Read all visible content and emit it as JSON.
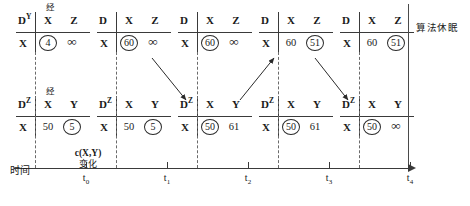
{
  "figure": {
    "right_side_label": "算法休眠",
    "time_axis_label": "时间",
    "annotation": {
      "line1": "c(X,Y)",
      "line2": "变化"
    }
  },
  "axis": {
    "ticks": [
      {
        "label": "t",
        "sub": "0",
        "x": 86
      },
      {
        "label": "t",
        "sub": "1",
        "x": 167
      },
      {
        "label": "t",
        "sub": "2",
        "x": 248
      },
      {
        "label": "t",
        "sub": "3",
        "x": 329
      },
      {
        "label": "t",
        "sub": "4",
        "x": 410
      }
    ]
  },
  "top_row": [
    {
      "jing": "经",
      "corner": "D",
      "corner_sup": "Y",
      "col1": "X",
      "col2": "Z",
      "row_label": "X",
      "cell1": {
        "text": "4",
        "circled": true,
        "infinity": false
      },
      "cell2": {
        "text": "∞",
        "circled": false,
        "infinity": true
      }
    },
    {
      "jing": "",
      "corner": "D",
      "corner_sup": "",
      "col1": "X",
      "col2": "Z",
      "row_label": "X",
      "cell1": {
        "text": "60",
        "circled": true,
        "infinity": false
      },
      "cell2": {
        "text": "∞",
        "circled": false,
        "infinity": true
      }
    },
    {
      "jing": "",
      "corner": "D",
      "corner_sup": "",
      "col1": "X",
      "col2": "Z",
      "row_label": "X",
      "cell1": {
        "text": "60",
        "circled": true,
        "infinity": false
      },
      "cell2": {
        "text": "∞",
        "circled": false,
        "infinity": true
      }
    },
    {
      "jing": "",
      "corner": "D",
      "corner_sup": "",
      "col1": "X",
      "col2": "Z",
      "row_label": "X",
      "cell1": {
        "text": "60",
        "circled": false,
        "infinity": false
      },
      "cell2": {
        "text": "51",
        "circled": true,
        "infinity": false
      }
    },
    {
      "jing": "",
      "corner": "D",
      "corner_sup": "",
      "col1": "X",
      "col2": "Z",
      "row_label": "X",
      "cell1": {
        "text": "60",
        "circled": false,
        "infinity": false
      },
      "cell2": {
        "text": "51",
        "circled": true,
        "infinity": false
      }
    }
  ],
  "bottom_row": [
    {
      "jing": "经",
      "corner": "D",
      "corner_sup": "Z",
      "col1": "X",
      "col2": "Y",
      "row_label": "X",
      "cell1": {
        "text": "50",
        "circled": false,
        "infinity": false
      },
      "cell2": {
        "text": "5",
        "circled": true,
        "infinity": false
      }
    },
    {
      "jing": "",
      "corner": "D",
      "corner_sup": "Z",
      "col1": "X",
      "col2": "Y",
      "row_label": "X",
      "cell1": {
        "text": "50",
        "circled": false,
        "infinity": false
      },
      "cell2": {
        "text": "5",
        "circled": true,
        "infinity": false
      }
    },
    {
      "jing": "",
      "corner": "D",
      "corner_sup": "Z",
      "col1": "X",
      "col2": "Y",
      "row_label": "X",
      "cell1": {
        "text": "50",
        "circled": true,
        "infinity": false
      },
      "cell2": {
        "text": "61",
        "circled": false,
        "infinity": false
      }
    },
    {
      "jing": "",
      "corner": "D",
      "corner_sup": "Z",
      "col1": "X",
      "col2": "Y",
      "row_label": "X",
      "cell1": {
        "text": "50",
        "circled": true,
        "infinity": false
      },
      "cell2": {
        "text": "61",
        "circled": false,
        "infinity": false
      }
    },
    {
      "jing": "",
      "corner": "D",
      "corner_sup": "Z",
      "col1": "X",
      "col2": "Y",
      "row_label": "X",
      "cell1": {
        "text": "50",
        "circled": true,
        "infinity": false
      },
      "cell2": {
        "text": "∞",
        "circled": false,
        "infinity": true
      }
    }
  ],
  "layout": {
    "top_table_x": [
      16,
      97,
      178,
      259,
      340
    ],
    "top_table_y": 12,
    "bottom_table_x": [
      16,
      97,
      178,
      259,
      340
    ],
    "bottom_table_y": 96,
    "dasher_x": [
      35,
      116,
      197,
      278,
      359
    ],
    "arrows": [
      {
        "x1": 152,
        "y1": 58,
        "x2": 186,
        "y2": 100,
        "dir": "down"
      },
      {
        "x1": 240,
        "y1": 100,
        "x2": 274,
        "y2": 58,
        "dir": "up"
      },
      {
        "x1": 315,
        "y1": 58,
        "x2": 348,
        "y2": 100,
        "dir": "down"
      }
    ]
  },
  "colors": {
    "ink": "#1a1a1a",
    "rule": "#3a3a3a",
    "dash": "#6a6a6a",
    "background": "#ffffff"
  }
}
